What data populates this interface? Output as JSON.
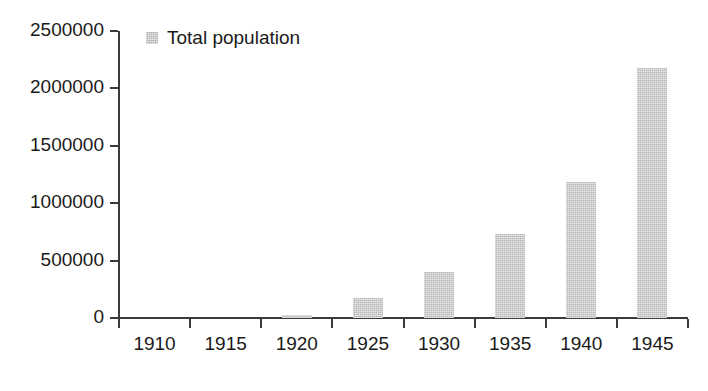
{
  "chart_data": {
    "type": "bar",
    "title": "",
    "subtitle": "",
    "xlabel": "",
    "ylabel": "",
    "categories": [
      "1910",
      "1915",
      "1920",
      "1925",
      "1930",
      "1935",
      "1940",
      "1945"
    ],
    "series": [
      {
        "name": "Total population",
        "color": "#c9c9c9",
        "values": [
          0,
          0,
          30000,
          175000,
          400000,
          735000,
          1185000,
          2180000
        ]
      }
    ],
    "ylim": [
      0,
      2500000
    ],
    "ytick_values": [
      0,
      500000,
      1000000,
      1500000,
      2000000,
      2500000
    ],
    "ytick_labels": [
      "0",
      "500000",
      "1000000",
      "1500000",
      "2000000",
      "2500000"
    ],
    "xtick_labels": [
      "1910",
      "1915",
      "1920",
      "1925",
      "1930",
      "1935",
      "1940",
      "1945"
    ],
    "grid": false,
    "legend": {
      "position": "top-left-inside",
      "entries": [
        {
          "label": "Total population",
          "swatch_color": "#c9c9c9"
        }
      ]
    },
    "axis_color": "#3a3a3a",
    "text_color": "#1a1a1a",
    "background_color": "#ffffff"
  }
}
